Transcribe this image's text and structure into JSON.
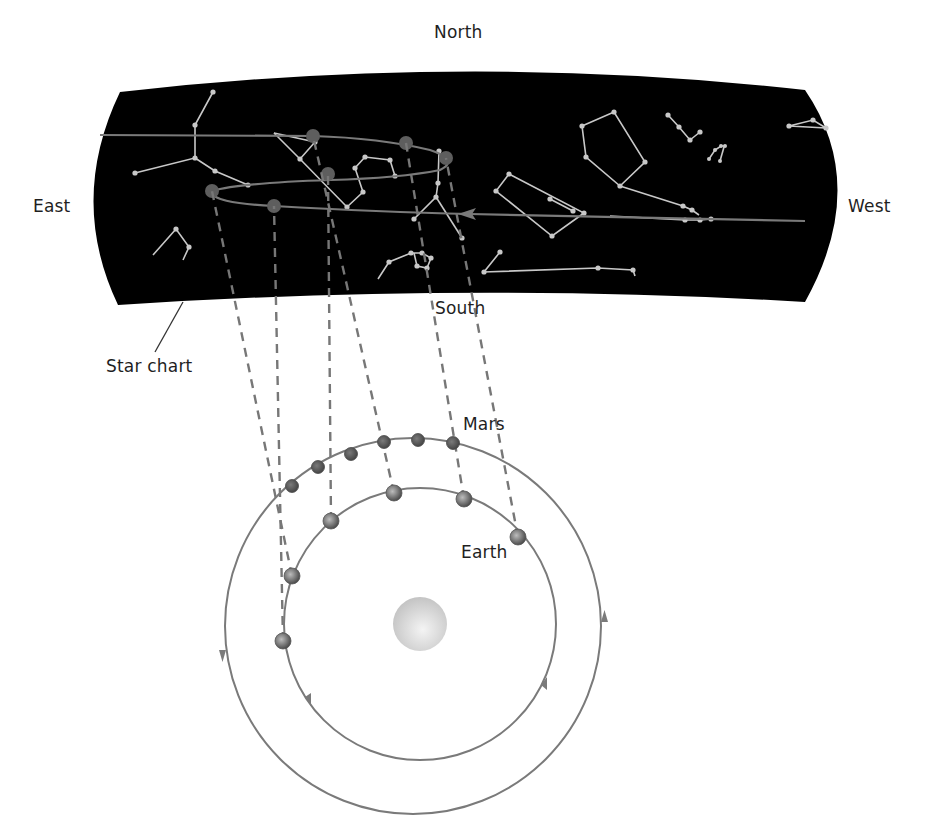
{
  "labels": {
    "north": "North",
    "south": "South",
    "east": "East",
    "west": "West",
    "star_chart": "Star chart",
    "mars": "Mars",
    "earth": "Earth"
  },
  "colors": {
    "sky": "#000000",
    "orbit": "#7a7a7a",
    "constellation": "#c8c8c8",
    "mars_dot": "#5e5e5e",
    "sight_line": "#777777",
    "sun": "#d9d9d9",
    "text": "#1f1f1f"
  },
  "sun": {
    "cx": 420,
    "cy": 624,
    "r": 27
  },
  "orbits": {
    "earth": {
      "cx": 420,
      "cy": 624,
      "r": 136
    },
    "mars": {
      "cx": 413,
      "cy": 626,
      "r": 188
    }
  },
  "positions": {
    "earth": [
      [
        283,
        641
      ],
      [
        292,
        576
      ],
      [
        331,
        521
      ],
      [
        394,
        493
      ],
      [
        464,
        499
      ],
      [
        518,
        537
      ]
    ],
    "mars": [
      [
        292,
        486
      ],
      [
        318,
        467
      ],
      [
        351,
        454
      ],
      [
        384,
        442
      ],
      [
        418,
        440
      ],
      [
        453,
        443
      ]
    ],
    "mars_on_sky": [
      [
        274,
        206
      ],
      [
        212,
        191
      ],
      [
        328,
        174
      ],
      [
        313,
        136
      ],
      [
        406,
        143
      ],
      [
        446,
        158
      ]
    ]
  }
}
